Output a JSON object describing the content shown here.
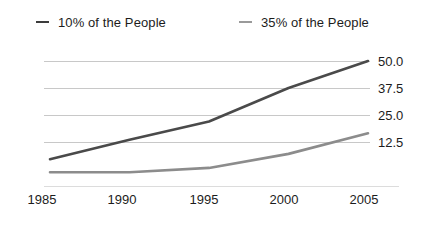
{
  "chart_data": {
    "type": "line",
    "title": "",
    "subtitle": "",
    "xlabel": "",
    "ylabel": "",
    "x": [
      1985,
      1990,
      1995,
      2000,
      2005
    ],
    "xtick_labels": [
      "1985",
      "1990",
      "1995",
      "2000",
      "2005"
    ],
    "ytick_labels": [
      "50.0",
      "37.5",
      "25.0",
      "12.5"
    ],
    "ytick_values": [
      50.0,
      37.5,
      25.0,
      12.5
    ],
    "ylim": [
      0,
      55
    ],
    "xlim": [
      1985,
      2005
    ],
    "grid": "horizontal",
    "legend_position": "top",
    "series": [
      {
        "name": "10% of the People",
        "color": "#4a4a4a",
        "values": [
          4.5,
          13.5,
          22.0,
          37.5,
          50.0
        ]
      },
      {
        "name": "35% of the People",
        "color": "#8c8c8c",
        "values": [
          -1.5,
          -1.5,
          0.5,
          7.0,
          16.5
        ]
      }
    ]
  },
  "legend": {
    "items": [
      {
        "label": "10% of the People",
        "marker": "line-dash-dark",
        "color": "#3c3c3c"
      },
      {
        "label": "35% of the People",
        "marker": "line-dash-gray",
        "color": "#9a9a9a"
      }
    ]
  },
  "axes": {
    "y_labels": [
      "50.0",
      "37.5",
      "25.0",
      "12.5"
    ],
    "x_labels": [
      "1985",
      "1990",
      "1995",
      "2000",
      "2005"
    ]
  },
  "colors": {
    "series_primary": "#4a4a4a",
    "series_secondary": "#8c8c8c",
    "gridline": "#c8c8c8",
    "background": "#ffffff",
    "text": "#1c1c1c"
  }
}
